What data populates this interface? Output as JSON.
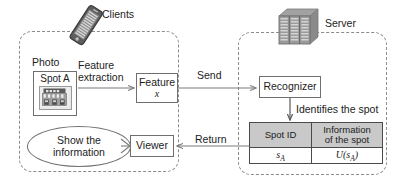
{
  "diagram": {
    "client_group": {
      "label": "Clients",
      "icon": "smartphone-icon"
    },
    "server_group": {
      "label": "Server",
      "icon": "server-rack-icon"
    },
    "photo": {
      "caption": "Photo",
      "card_label": "Spot A",
      "thumb_icon": "shop-photo-icon",
      "thumb_sign_text": "SHOP"
    },
    "feature_extraction_label": "Feature\nextraction",
    "feature_extraction_line1": "Feature",
    "feature_extraction_line2": "extraction",
    "feature_node": {
      "label": "Feature",
      "sub": "x"
    },
    "recognizer_node": {
      "label": "Recognizer"
    },
    "viewer_node": {
      "label": "Viewer"
    },
    "show_info_ellipse": {
      "line1": "Show the",
      "line2": "information"
    },
    "send_label": "Send",
    "return_label": "Return",
    "identifies_label": "Identifies the spot",
    "table": {
      "headers": [
        "Spot ID",
        "Information\nof the spot"
      ],
      "header_1": "Spot ID",
      "header_2_line1": "Information",
      "header_2_line2": "of the spot",
      "rows": [
        {
          "spot_id": "sA",
          "info": "U(sA)"
        }
      ],
      "cell_spot_id_base": "s",
      "cell_spot_id_sub": "A",
      "cell_info_pre": "U(s",
      "cell_info_sub": "A",
      "cell_info_post": ")"
    },
    "colors": {
      "stroke": "#6f6f6f",
      "dashed_stroke": "#8b8b8b",
      "table_header_fill": "#c9c9c9",
      "text": "#1c1c1c",
      "arrow": "#7a7a7a",
      "background": "#ffffff"
    }
  }
}
